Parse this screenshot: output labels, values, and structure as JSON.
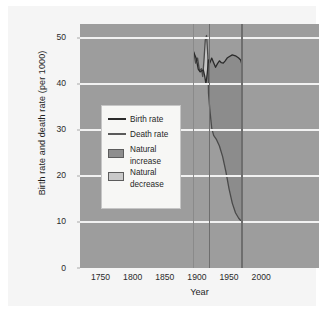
{
  "chart_data": {
    "type": "line",
    "title": "Mexico's birth and death rates,\n1920–1970",
    "title_line1": "Mexico's birth and death rates,",
    "title_line2": "1920–1970",
    "xlabel": "Year",
    "ylabel": "Birth rate and death rate (per 1000)",
    "xlim": [
      1718,
      2090
    ],
    "ylim": [
      0,
      53
    ],
    "xticks": [
      1750,
      1800,
      1850,
      1900,
      1950,
      2000
    ],
    "xtick_labels": [
      "1750",
      "1800",
      "1850",
      "1900",
      "1950",
      "2000"
    ],
    "yticks": [
      0,
      10,
      20,
      30,
      40,
      50
    ],
    "ytick_labels": [
      "0",
      "10",
      "20",
      "30",
      "40",
      "50"
    ],
    "grid": "horizontal",
    "legend_position": "inside-left",
    "plot_background": "#9d9d9d",
    "gridline_color": "#f2f2f2",
    "reference_lines": [
      1895,
      1920,
      1970
    ],
    "series": [
      {
        "name": "Birth rate",
        "color": "#2b2b2b",
        "points": [
          [
            1895,
            46.8
          ],
          [
            1899,
            45.5
          ],
          [
            1902,
            43.2
          ],
          [
            1905,
            42.6
          ],
          [
            1908,
            42.9
          ],
          [
            1910,
            43.0
          ],
          [
            1912,
            41.8
          ],
          [
            1914,
            40.0
          ],
          [
            1916,
            42.2
          ],
          [
            1918,
            45.2
          ],
          [
            1920,
            44.5
          ],
          [
            1923,
            45.6
          ],
          [
            1926,
            44.6
          ],
          [
            1929,
            43.6
          ],
          [
            1932,
            44.4
          ],
          [
            1935,
            45.0
          ],
          [
            1938,
            44.6
          ],
          [
            1941,
            44.5
          ],
          [
            1944,
            45.0
          ],
          [
            1947,
            45.6
          ],
          [
            1950,
            45.9
          ],
          [
            1955,
            46.3
          ],
          [
            1960,
            46.1
          ],
          [
            1965,
            45.6
          ],
          [
            1968,
            45.2
          ],
          [
            1970,
            44.2
          ]
        ]
      },
      {
        "name": "Death rate",
        "color": "#4a4a4a",
        "points": [
          [
            1895,
            47.0
          ],
          [
            1898,
            44.5
          ],
          [
            1901,
            45.6
          ],
          [
            1904,
            42.8
          ],
          [
            1907,
            43.3
          ],
          [
            1909,
            41.6
          ],
          [
            1911,
            45.2
          ],
          [
            1913,
            49.5
          ],
          [
            1915,
            50.5
          ],
          [
            1917,
            46.0
          ],
          [
            1918,
            38.0
          ],
          [
            1920,
            34.5
          ],
          [
            1923,
            30.4
          ],
          [
            1926,
            28.8
          ],
          [
            1930,
            28.0
          ],
          [
            1935,
            26.5
          ],
          [
            1940,
            24.2
          ],
          [
            1945,
            21.0
          ],
          [
            1950,
            17.2
          ],
          [
            1955,
            14.1
          ],
          [
            1960,
            12.0
          ],
          [
            1965,
            10.8
          ],
          [
            1970,
            10.0
          ]
        ]
      }
    ],
    "areas": [
      {
        "name": "Natural increase",
        "color": "#8c8c8c"
      },
      {
        "name": "Natural decrease",
        "color": "#c4c4c4"
      }
    ]
  },
  "legend": {
    "items": [
      {
        "label": "Birth rate",
        "type": "line",
        "color": "#2b2b2b"
      },
      {
        "label": "Death rate",
        "type": "line",
        "color": "#5a5a5a"
      },
      {
        "label_line1": "Natural",
        "label_line2": "increase",
        "type": "swatch",
        "color": "#8e8e8e"
      },
      {
        "label_line1": "Natural",
        "label_line2": "decrease",
        "type": "swatch",
        "color": "#c9c9c9"
      }
    ]
  }
}
